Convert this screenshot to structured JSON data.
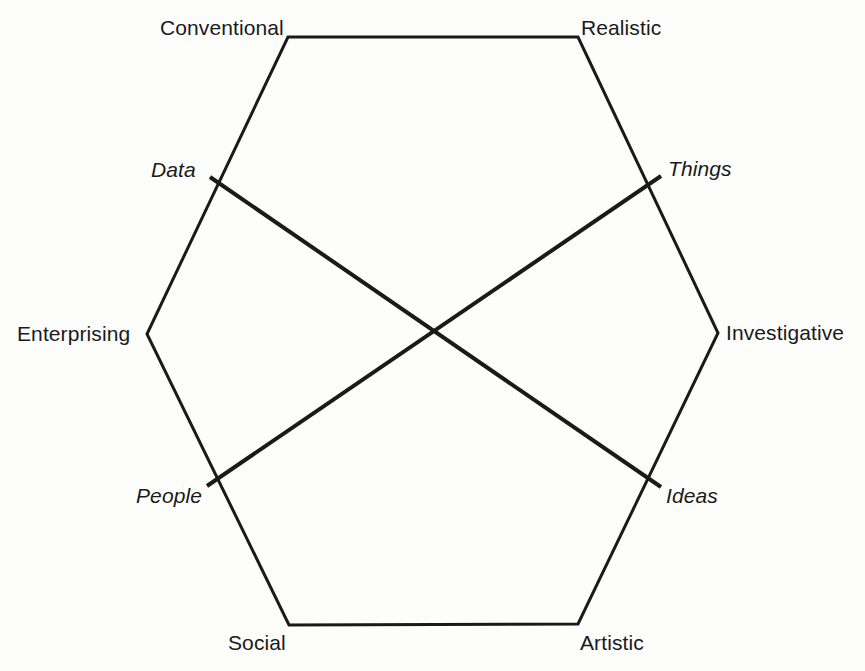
{
  "diagram": {
    "background_color": "#fdfdfc",
    "line_color": "#1a1a1a",
    "text_color": "#1a1a1a",
    "hexagon": {
      "stroke_width": 3,
      "vertices": [
        {
          "id": "conventional",
          "label": "Conventional",
          "x": 288,
          "y": 37,
          "label_x": 160,
          "label_y": 17
        },
        {
          "id": "realistic",
          "label": "Realistic",
          "x": 578,
          "y": 37,
          "label_x": 581,
          "label_y": 17
        },
        {
          "id": "investigative",
          "label": "Investigative",
          "x": 718,
          "y": 333,
          "label_x": 726,
          "label_y": 322
        },
        {
          "id": "artistic",
          "label": "Artistic",
          "x": 578,
          "y": 624,
          "label_x": 580,
          "label_y": 632
        },
        {
          "id": "social",
          "label": "Social",
          "x": 289,
          "y": 625,
          "label_x": 228,
          "label_y": 632
        },
        {
          "id": "enterprising",
          "label": "Enterprising",
          "x": 147,
          "y": 334,
          "label_x": 17,
          "label_y": 323
        }
      ]
    },
    "axes": [
      {
        "id": "data-ideas",
        "stroke_width": 4,
        "from": {
          "label": "Data",
          "x": 210,
          "y": 177,
          "label_x": 151,
          "label_y": 159
        },
        "to": {
          "label": "Ideas",
          "x": 661,
          "y": 487,
          "label_x": 666,
          "label_y": 485
        }
      },
      {
        "id": "things-people",
        "stroke_width": 4,
        "from": {
          "label": "Things",
          "x": 661,
          "y": 176,
          "label_x": 668,
          "label_y": 158
        },
        "to": {
          "label": "People",
          "x": 207,
          "y": 486,
          "label_x": 136,
          "label_y": 485
        }
      }
    ],
    "intersection": {
      "x": 432,
      "y": 331
    }
  }
}
